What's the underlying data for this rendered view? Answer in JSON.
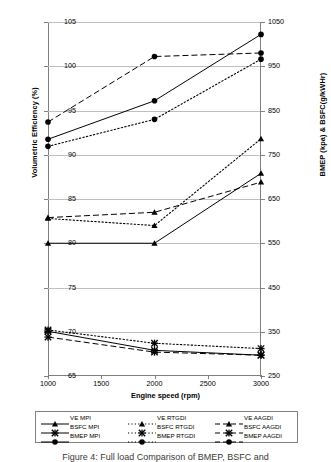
{
  "chart_data": {
    "type": "line",
    "title": "",
    "xlabel": "Engine speed (rpm)",
    "ylabel": "Volumetric Efficiency (%)",
    "y2label": "BMEP (kpa) & BSFC(g/kWHr)",
    "x": [
      1000,
      2000,
      3000
    ],
    "xlim": [
      1000,
      3000
    ],
    "xticks": [
      1000,
      1500,
      2000,
      2500,
      3000
    ],
    "ylim": [
      65,
      105
    ],
    "yticks": [
      65,
      70,
      75,
      80,
      85,
      90,
      95,
      100,
      105
    ],
    "y2lim": [
      250,
      1050
    ],
    "y2ticks": [
      250,
      350,
      450,
      550,
      650,
      750,
      850,
      950,
      1050
    ],
    "grid": true,
    "legend_position": "bottom",
    "series": [
      {
        "name": "VE MPI",
        "axis": "left",
        "marker": "triangle",
        "line": "solid",
        "values": [
          80.0,
          80.0,
          87.9
        ]
      },
      {
        "name": "VE RTGDI",
        "axis": "left",
        "marker": "triangle",
        "line": "dotted",
        "values": [
          82.8,
          82.0,
          91.8
        ]
      },
      {
        "name": "VE AAGDI",
        "axis": "left",
        "marker": "triangle",
        "line": "dashed",
        "values": [
          82.9,
          83.5,
          86.9
        ]
      },
      {
        "name": "BSFC MPI",
        "axis": "right",
        "marker": "cross",
        "line": "solid",
        "values": [
          351,
          308,
          297
        ]
      },
      {
        "name": "BSFC RTGDI",
        "axis": "right",
        "marker": "cross",
        "line": "dotted",
        "values": [
          354,
          324,
          312
        ]
      },
      {
        "name": "BSFC AAGDI",
        "axis": "right",
        "marker": "cross",
        "line": "dashed",
        "values": [
          338,
          304,
          297
        ]
      },
      {
        "name": "BMEP MPI",
        "axis": "right",
        "marker": "circle",
        "line": "solid",
        "values": [
          785,
          872,
          1022
        ]
      },
      {
        "name": "BMEP RTGDI",
        "axis": "right",
        "marker": "circle",
        "line": "dotted",
        "values": [
          769,
          830,
          966
        ]
      },
      {
        "name": "BMEP AAGDI",
        "axis": "right",
        "marker": "circle",
        "line": "dashed",
        "values": [
          824,
          972,
          980
        ]
      }
    ]
  },
  "axes": {
    "ylabel_left": "Volumetric Efficiency (%)",
    "ylabel_right": "BMEP (kpa) & BSFC(g/kWHr)",
    "xlabel": "Engine speed (rpm)",
    "left_ticks": [
      "105",
      "100",
      "95",
      "90",
      "85",
      "80",
      "75",
      "70",
      "65"
    ],
    "right_ticks": [
      "1050",
      "950",
      "850",
      "750",
      "650",
      "550",
      "450",
      "350",
      "250"
    ],
    "x_ticks": [
      "1000",
      "1500",
      "2000",
      "2500",
      "3000"
    ]
  },
  "legend": {
    "col1": [
      "VE MPI",
      "BSFC MPI",
      "BMEP MPI"
    ],
    "col2": [
      "VE RTGDI",
      "BSFC RTGDI",
      "BMEP RTGDI"
    ],
    "col3": [
      "VE AAGDI",
      "BSFC AAGDI",
      "BMEP AAGDI"
    ]
  },
  "caption": {
    "text": "Figure 4: Full load Comparison of BMEP, BSFC and"
  }
}
